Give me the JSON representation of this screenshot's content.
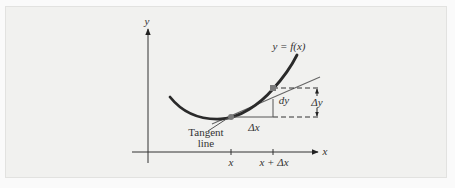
{
  "diagram": {
    "y_axis_label": "y",
    "x_axis_label": "x",
    "curve_label": "y = f(x)",
    "tangent_label_line1": "Tangent",
    "tangent_label_line2": "line",
    "dy_label": "dy",
    "delta_y_label": "Δy",
    "delta_x_label": "Δx",
    "tick_x_label": "x",
    "tick_x_plus_dx_label": "x + Δx",
    "colors": {
      "background": "#f1f1ef",
      "curve": "#2b2b2b",
      "tangent": "#5a5a5a",
      "point": "#7a7a7a"
    }
  }
}
